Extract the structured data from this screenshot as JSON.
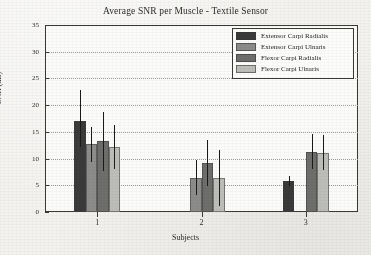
{
  "chart_data": {
    "type": "bar",
    "title": "Average SNR per Muscle - Textile Sensor",
    "xlabel": "Subjects",
    "ylabel": "SNR (dB)",
    "categories": [
      "1",
      "2",
      "3"
    ],
    "xtick_labels": [
      "1",
      "2",
      "3"
    ],
    "ytick_labels": [
      "0",
      "5",
      "10",
      "15",
      "20",
      "25",
      "30",
      "35"
    ],
    "ylim": [
      0,
      35
    ],
    "ytick_step": 5,
    "grid": "horizontal-dotted",
    "legend_position": "top-right",
    "error_bars": true,
    "series": [
      {
        "name": "Extensor Carpi Radialis",
        "color": "#3a3a3a",
        "values": [
          17.0,
          0.0,
          5.8
        ],
        "err_low": [
          12.2,
          0.0,
          4.9
        ],
        "err_high": [
          22.8,
          0.0,
          6.7
        ]
      },
      {
        "name": "Extensor Carpi Ulnaris",
        "color": "#8c8c8a",
        "values": [
          12.7,
          6.3,
          0.0
        ],
        "err_low": [
          9.4,
          3.2,
          0.0
        ],
        "err_high": [
          16.0,
          9.7,
          0.0
        ]
      },
      {
        "name": "Flexor Carpi Radialis",
        "color": "#6e6e6c",
        "values": [
          13.3,
          9.2,
          11.3
        ],
        "err_low": [
          7.6,
          4.8,
          8.1
        ],
        "err_high": [
          18.8,
          13.5,
          14.6
        ]
      },
      {
        "name": "Flexor Carpi Ulnaris",
        "color": "#bdbdb9",
        "values": [
          12.2,
          6.3,
          11.0
        ],
        "err_low": [
          8.0,
          1.1,
          7.9
        ],
        "err_high": [
          16.3,
          11.6,
          14.4
        ]
      }
    ]
  }
}
